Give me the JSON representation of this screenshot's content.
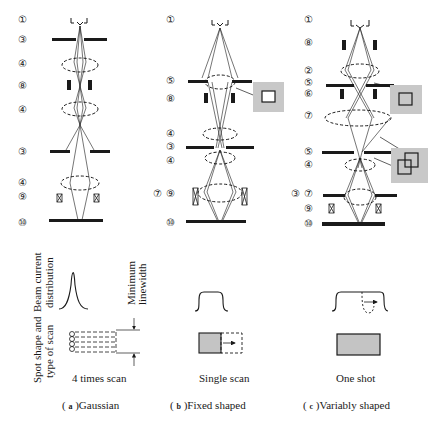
{
  "figure": {
    "columns": [
      {
        "id": "a",
        "caption_letter": "a",
        "caption_text": "Gaussian",
        "scan_label": "4 times scan",
        "labels": [
          "①",
          "③",
          "④",
          "⑧",
          "④",
          "③",
          "④",
          "⑨",
          "⑩"
        ]
      },
      {
        "id": "b",
        "caption_letter": "b",
        "caption_text": "Fixed shaped",
        "scan_label": "Single scan",
        "labels": [
          "①",
          "⑤",
          "⑧",
          "④",
          "③",
          "④",
          "⑦",
          "⑨",
          "⑩"
        ]
      },
      {
        "id": "c",
        "caption_letter": "c",
        "caption_text": "Variably shaped",
        "scan_label": "One shot",
        "labels": [
          "①",
          "⑧",
          "②",
          "⑤",
          "⑥",
          "⑦",
          "⑤",
          "④",
          "③",
          "⑦",
          "⑨",
          "⑩"
        ]
      }
    ],
    "row_labels": {
      "beam_current_line1": "Beam current",
      "beam_current_line2": "distribution",
      "spot_shape_line1": "Spot shape and",
      "spot_shape_line2": "type of scan"
    },
    "annotation": {
      "min_linewidth_line1": "Minimum",
      "min_linewidth_line2": "linewidth"
    },
    "colors": {
      "ink": "#1a1a1a",
      "aperture_inset_bg": "#c8c8c8",
      "spot_fill": "#c4c4c4"
    }
  }
}
